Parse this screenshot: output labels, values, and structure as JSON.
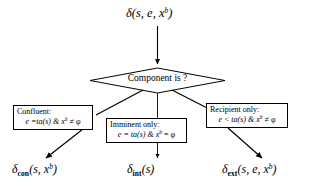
{
  "diagram": {
    "background_color": "#ffffff",
    "line_color": "#000000",
    "box_border_color": "#000000",
    "width": 315,
    "height": 189
  },
  "input_node": {
    "name": "delta-input",
    "symbol": "δ",
    "args": "(s, e, x",
    "superscript": "b",
    "close": ")",
    "full_text": "δ(s, e, xᵇ)"
  },
  "decision": {
    "name": "component-is-decision",
    "label": "Component is ?",
    "shape": "diamond"
  },
  "branches": [
    {
      "id": "confluent",
      "title": "Confluent:",
      "formula_prefix": "e =ta(s) & x",
      "formula_superscript": "b",
      "formula_suffix": " ≠ φ",
      "formula_full": "e =ta(s) & xᵇ ≠ φ",
      "output_symbol": "δ",
      "output_subscript": "con",
      "output_args": "(s, x",
      "output_superscript": "b",
      "output_close": ")",
      "output_full": "δcon(s, xᵇ)"
    },
    {
      "id": "imminent",
      "title": "Imminent only:",
      "formula_prefix": "e = ta(s) & x",
      "formula_superscript": "b",
      "formula_suffix": " = φ",
      "formula_full": "e = ta(s) & xᵇ = φ",
      "output_symbol": "δ",
      "output_subscript": "int",
      "output_args": "(s",
      "output_superscript": "",
      "output_close": ")",
      "output_full": "δint(s)"
    },
    {
      "id": "recipient",
      "title": "Recipient only:",
      "formula_prefix": "e < ta(s) & x",
      "formula_superscript": "b",
      "formula_suffix": " ≠ φ",
      "formula_full": "e < ta(s) & xᵇ ≠ φ",
      "output_symbol": "δ",
      "output_subscript": "ext",
      "output_args": "(s, e, x",
      "output_superscript": "b",
      "output_close": ")",
      "output_full": "δext(s, e, xᵇ)"
    }
  ]
}
